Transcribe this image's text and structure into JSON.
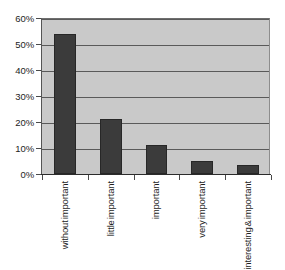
{
  "chart_data": {
    "type": "bar",
    "title": "",
    "subtitle": "",
    "xlabel": "",
    "ylabel": "",
    "categories": [
      "without important",
      "little important",
      "important",
      "very important",
      "interesting & important"
    ],
    "category_lines": [
      [
        "without",
        "important"
      ],
      [
        "little",
        "important"
      ],
      [
        "important"
      ],
      [
        "very",
        "important"
      ],
      [
        "interesting",
        "&",
        "important"
      ]
    ],
    "values": [
      54,
      21,
      11,
      5,
      3.5
    ],
    "value_labels": [
      "54%",
      "21%",
      "11%",
      "5%",
      "3.5%"
    ],
    "ylim": [
      0,
      60
    ],
    "ytick_values": [
      0,
      10,
      20,
      30,
      40,
      50,
      60
    ],
    "ytick_labels": [
      "0%",
      "10%",
      "20%",
      "30%",
      "40%",
      "50%",
      "60%"
    ],
    "grid": true,
    "grid_axis": "y",
    "legend": false,
    "legend_position": "none",
    "orientation": "vertical",
    "xtick_label_rotation": 90
  },
  "style": {
    "page_background": "#ffffff",
    "plot_background": "#c9c9c9",
    "bar_color": "#3b3b3b",
    "bar_edge_color": "#272727",
    "gridline_color": "#5a5a5a",
    "axis_color": "#2b2b2b",
    "text_color": "#1d1d1d"
  }
}
